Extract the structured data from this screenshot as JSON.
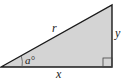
{
  "diagram": {
    "type": "right-triangle",
    "labels": {
      "hypotenuse": "r",
      "opposite": "y",
      "adjacent": "x",
      "angle": "a°"
    },
    "colors": {
      "fill": "#d4d4d4",
      "stroke": "#1a1a1a"
    }
  }
}
